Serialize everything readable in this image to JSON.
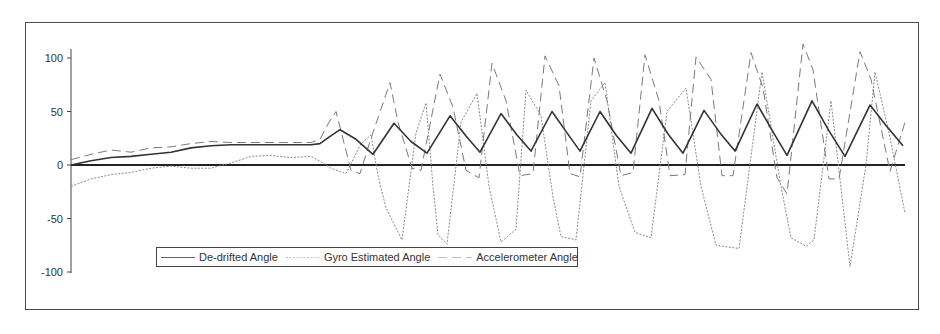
{
  "chart_data": {
    "type": "line",
    "title": "",
    "xlabel": "",
    "ylabel": "",
    "ylim": [
      -100,
      100
    ],
    "yticks": [
      100,
      50,
      0,
      -50,
      -100
    ],
    "xticks": [],
    "grid": false,
    "legend_position": "bottom-left inside plot",
    "x_unit": "sample index (approx, 0-834)",
    "series": [
      {
        "name": "De-drifted Angle",
        "style": "solid",
        "color": "#333333",
        "points": [
          [
            0,
            0
          ],
          [
            20,
            4
          ],
          [
            40,
            7
          ],
          [
            60,
            8
          ],
          [
            80,
            10
          ],
          [
            100,
            12
          ],
          [
            120,
            16
          ],
          [
            140,
            18
          ],
          [
            160,
            19
          ],
          [
            200,
            19
          ],
          [
            240,
            19
          ],
          [
            249,
            20
          ],
          [
            258,
            26
          ],
          [
            269,
            33
          ],
          [
            285,
            24
          ],
          [
            302,
            10
          ],
          [
            323,
            39
          ],
          [
            340,
            22
          ],
          [
            356,
            11
          ],
          [
            379,
            46
          ],
          [
            395,
            27
          ],
          [
            409,
            12
          ],
          [
            430,
            48
          ],
          [
            446,
            28
          ],
          [
            460,
            13
          ],
          [
            481,
            50
          ],
          [
            496,
            30
          ],
          [
            509,
            13
          ],
          [
            529,
            50
          ],
          [
            545,
            28
          ],
          [
            560,
            11
          ],
          [
            581,
            53
          ],
          [
            597,
            29
          ],
          [
            612,
            11
          ],
          [
            633,
            51
          ],
          [
            649,
            30
          ],
          [
            664,
            13
          ],
          [
            686,
            57
          ],
          [
            702,
            31
          ],
          [
            716,
            9
          ],
          [
            741,
            60
          ],
          [
            758,
            32
          ],
          [
            774,
            8
          ],
          [
            799,
            56
          ],
          [
            815,
            37
          ],
          [
            832,
            18
          ]
        ]
      },
      {
        "name": "Gyro Estimated Angle",
        "style": "dotted",
        "color": "#8a8a8a",
        "points": [
          [
            0,
            -20
          ],
          [
            20,
            -13
          ],
          [
            40,
            -9
          ],
          [
            60,
            -7
          ],
          [
            80,
            -3
          ],
          [
            100,
            -1
          ],
          [
            120,
            -3
          ],
          [
            140,
            -3
          ],
          [
            160,
            2
          ],
          [
            180,
            8
          ],
          [
            200,
            9
          ],
          [
            220,
            7
          ],
          [
            240,
            8
          ],
          [
            250,
            3
          ],
          [
            260,
            -3
          ],
          [
            275,
            -8
          ],
          [
            290,
            20
          ],
          [
            300,
            28
          ],
          [
            307,
            -10
          ],
          [
            315,
            -40
          ],
          [
            331,
            -70
          ],
          [
            345,
            30
          ],
          [
            355,
            58
          ],
          [
            362,
            -20
          ],
          [
            367,
            -65
          ],
          [
            376,
            -74
          ],
          [
            390,
            40
          ],
          [
            406,
            67
          ],
          [
            418,
            -20
          ],
          [
            430,
            -72
          ],
          [
            445,
            -60
          ],
          [
            455,
            70
          ],
          [
            470,
            46
          ],
          [
            482,
            -30
          ],
          [
            490,
            -67
          ],
          [
            505,
            -70
          ],
          [
            520,
            60
          ],
          [
            534,
            77
          ],
          [
            548,
            -20
          ],
          [
            564,
            -63
          ],
          [
            580,
            -68
          ],
          [
            596,
            50
          ],
          [
            615,
            72
          ],
          [
            630,
            -20
          ],
          [
            645,
            -75
          ],
          [
            668,
            -78
          ],
          [
            691,
            87
          ],
          [
            710,
            -20
          ],
          [
            720,
            -68
          ],
          [
            735,
            -76
          ],
          [
            743,
            -70
          ],
          [
            760,
            60
          ],
          [
            779,
            -95
          ],
          [
            795,
            0
          ],
          [
            804,
            87
          ],
          [
            818,
            30
          ],
          [
            834,
            -45
          ]
        ]
      },
      {
        "name": "Accelerometer Angle",
        "style": "dashed",
        "color": "#7a7a7a",
        "points": [
          [
            0,
            5
          ],
          [
            20,
            10
          ],
          [
            40,
            14
          ],
          [
            60,
            12
          ],
          [
            80,
            16
          ],
          [
            100,
            17
          ],
          [
            120,
            20
          ],
          [
            140,
            22
          ],
          [
            160,
            21
          ],
          [
            200,
            21
          ],
          [
            240,
            21
          ],
          [
            249,
            24
          ],
          [
            258,
            40
          ],
          [
            265,
            50
          ],
          [
            280,
            -5
          ],
          [
            289,
            -8
          ],
          [
            300,
            25
          ],
          [
            319,
            77
          ],
          [
            327,
            40
          ],
          [
            341,
            -3
          ],
          [
            350,
            -5
          ],
          [
            369,
            85
          ],
          [
            382,
            54
          ],
          [
            395,
            -5
          ],
          [
            408,
            -12
          ],
          [
            421,
            95
          ],
          [
            435,
            60
          ],
          [
            449,
            -10
          ],
          [
            462,
            -8
          ],
          [
            474,
            102
          ],
          [
            488,
            74
          ],
          [
            499,
            -8
          ],
          [
            509,
            -11
          ],
          [
            523,
            100
          ],
          [
            536,
            60
          ],
          [
            550,
            -10
          ],
          [
            562,
            -7
          ],
          [
            574,
            103
          ],
          [
            588,
            60
          ],
          [
            599,
            -10
          ],
          [
            614,
            -9
          ],
          [
            625,
            101
          ],
          [
            640,
            80
          ],
          [
            651,
            -10
          ],
          [
            662,
            -10
          ],
          [
            680,
            105
          ],
          [
            692,
            72
          ],
          [
            706,
            -12
          ],
          [
            716,
            -27
          ],
          [
            732,
            113
          ],
          [
            742,
            89
          ],
          [
            758,
            -13
          ],
          [
            768,
            -13
          ],
          [
            789,
            106
          ],
          [
            800,
            80
          ],
          [
            819,
            -6
          ],
          [
            834,
            40
          ]
        ]
      }
    ]
  },
  "legend": {
    "items": [
      {
        "label": "De-drifted Angle",
        "style": "solid"
      },
      {
        "label": "Gyro Estimated Angle",
        "style": "dotted"
      },
      {
        "label": "Accelerometer Angle",
        "style": "dashed"
      }
    ]
  },
  "axis": {
    "y_tick_labels": [
      "100",
      "50",
      "0",
      "-50",
      "-100"
    ]
  }
}
